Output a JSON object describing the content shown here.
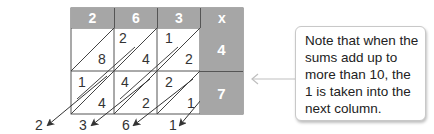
{
  "diagram": {
    "type": "lattice-multiplication",
    "header": {
      "digits": [
        "2",
        "6",
        "3"
      ],
      "operator": "x"
    },
    "multipliers": [
      "4",
      "7"
    ],
    "cells": [
      [
        {
          "tens": "",
          "units": "8"
        },
        {
          "tens": "2",
          "units": "4"
        },
        {
          "tens": "1",
          "units": "2"
        }
      ],
      [
        {
          "tens": "1",
          "units": "4"
        },
        {
          "tens": "4",
          "units": "2"
        },
        {
          "tens": "2",
          "units": "1"
        }
      ]
    ],
    "result_digits": [
      "2",
      "3",
      "6",
      "1"
    ],
    "callout": {
      "text": "Note that when the sums add up to more than 10, the 1 is taken into the next column."
    },
    "colors": {
      "header_fill": "#a6a6a6",
      "grid_line": "#555555",
      "arrow": "#333333",
      "callout_arrow": "#bfbfbf"
    }
  }
}
